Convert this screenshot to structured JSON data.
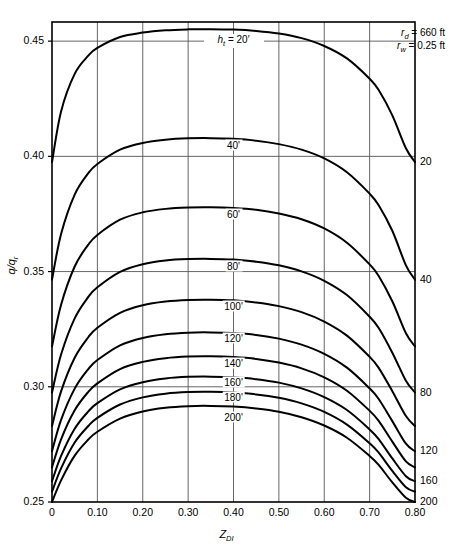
{
  "chart_data": {
    "type": "line",
    "title": "",
    "xlabel": "Z_DI",
    "ylabel": "q/q_r",
    "xlim": [
      0,
      0.8
    ],
    "ylim": [
      0.25,
      0.4583
    ],
    "grid": true,
    "x_ticks": [
      "0",
      "0.10",
      "0.20",
      "0.30",
      "0.40",
      "0.50",
      "0.60",
      "0.70",
      "0.80"
    ],
    "x_tick_values": [
      0,
      0.1,
      0.2,
      0.3,
      0.4,
      0.5,
      0.6,
      0.7,
      0.8
    ],
    "y_ticks": [
      "0.25",
      "0.30",
      "0.35",
      "0.40",
      "0.45"
    ],
    "y_tick_values": [
      0.25,
      0.3,
      0.35,
      0.4,
      0.45
    ],
    "annotations": [
      {
        "name": "rd",
        "text": "r_d = 660 ft",
        "sym": "r",
        "sub": "d",
        "rest": " = 660 ft"
      },
      {
        "name": "rw",
        "text": "r_w = 0.25 ft",
        "sym": "r",
        "sub": "w",
        "rest": " = 0.25 ft"
      }
    ],
    "first_curve_label": {
      "sym": "h",
      "sub": "t",
      "rest": " = 20′"
    },
    "right_axis_labels": [
      "20",
      "40",
      "80",
      "120",
      "160",
      "200"
    ],
    "right_axis_values": [
      0.3975,
      0.3465,
      0.2975,
      0.272,
      0.259,
      0.25
    ],
    "series": [
      {
        "name": "20'",
        "label": "h_t = 20'",
        "x": [
          0,
          0.02,
          0.05,
          0.08,
          0.1,
          0.15,
          0.2,
          0.25,
          0.3,
          0.35,
          0.4,
          0.45,
          0.5,
          0.55,
          0.6,
          0.65,
          0.7,
          0.72,
          0.75,
          0.78,
          0.8
        ],
        "values": [
          0.3975,
          0.4195,
          0.4358,
          0.4437,
          0.4471,
          0.4518,
          0.4537,
          0.4547,
          0.4551,
          0.4552,
          0.455,
          0.4544,
          0.4533,
          0.4513,
          0.4479,
          0.4425,
          0.4337,
          0.4288,
          0.4178,
          0.4035,
          0.3975
        ]
      },
      {
        "name": "40'",
        "label": "40'",
        "x": [
          0,
          0.02,
          0.05,
          0.08,
          0.1,
          0.15,
          0.2,
          0.25,
          0.3,
          0.35,
          0.4,
          0.45,
          0.5,
          0.55,
          0.6,
          0.65,
          0.7,
          0.72,
          0.75,
          0.78,
          0.8
        ],
        "values": [
          0.3465,
          0.3663,
          0.3834,
          0.3927,
          0.3967,
          0.4029,
          0.4058,
          0.4072,
          0.4078,
          0.4079,
          0.4076,
          0.4068,
          0.4053,
          0.4029,
          0.3991,
          0.3931,
          0.3838,
          0.3788,
          0.3677,
          0.3527,
          0.3465
        ]
      },
      {
        "name": "60'",
        "label": "60'",
        "x": [
          0,
          0.02,
          0.05,
          0.08,
          0.1,
          0.15,
          0.2,
          0.25,
          0.3,
          0.35,
          0.4,
          0.45,
          0.5,
          0.55,
          0.6,
          0.65,
          0.7,
          0.72,
          0.75,
          0.78,
          0.8
        ],
        "values": [
          0.3175,
          0.3356,
          0.3522,
          0.3617,
          0.3659,
          0.3725,
          0.3757,
          0.3772,
          0.3778,
          0.3779,
          0.3776,
          0.3768,
          0.3752,
          0.3727,
          0.3687,
          0.3625,
          0.3531,
          0.3481,
          0.3371,
          0.3232,
          0.3175
        ]
      },
      {
        "name": "80'",
        "label": "80'",
        "x": [
          0,
          0.02,
          0.05,
          0.08,
          0.1,
          0.15,
          0.2,
          0.25,
          0.3,
          0.35,
          0.4,
          0.45,
          0.5,
          0.55,
          0.6,
          0.65,
          0.7,
          0.72,
          0.75,
          0.78,
          0.8
        ],
        "values": [
          0.2975,
          0.314,
          0.3297,
          0.339,
          0.3432,
          0.3499,
          0.3532,
          0.3548,
          0.3554,
          0.3555,
          0.3552,
          0.3543,
          0.3527,
          0.3501,
          0.346,
          0.3398,
          0.3304,
          0.3255,
          0.3148,
          0.3026,
          0.2975
        ]
      },
      {
        "name": "100'",
        "label": "100'",
        "x": [
          0,
          0.02,
          0.05,
          0.08,
          0.1,
          0.15,
          0.2,
          0.25,
          0.3,
          0.35,
          0.4,
          0.45,
          0.5,
          0.55,
          0.6,
          0.65,
          0.7,
          0.72,
          0.75,
          0.78,
          0.8
        ],
        "values": [
          0.283,
          0.298,
          0.3126,
          0.3215,
          0.3256,
          0.3321,
          0.3354,
          0.337,
          0.3377,
          0.3378,
          0.3375,
          0.3366,
          0.335,
          0.3324,
          0.3283,
          0.3222,
          0.313,
          0.3082,
          0.2981,
          0.2873,
          0.283
        ]
      },
      {
        "name": "120'",
        "label": "120'",
        "x": [
          0,
          0.02,
          0.05,
          0.08,
          0.1,
          0.15,
          0.2,
          0.25,
          0.3,
          0.35,
          0.4,
          0.45,
          0.5,
          0.55,
          0.6,
          0.65,
          0.7,
          0.72,
          0.75,
          0.78,
          0.8
        ],
        "values": [
          0.272,
          0.2856,
          0.2992,
          0.3077,
          0.3116,
          0.318,
          0.3212,
          0.3228,
          0.3235,
          0.3236,
          0.3233,
          0.3225,
          0.3209,
          0.3183,
          0.3143,
          0.3083,
          0.2993,
          0.2947,
          0.2851,
          0.2753,
          0.272
        ]
      },
      {
        "name": "140'",
        "label": "140'",
        "x": [
          0,
          0.02,
          0.05,
          0.08,
          0.1,
          0.15,
          0.2,
          0.25,
          0.3,
          0.35,
          0.4,
          0.45,
          0.5,
          0.55,
          0.6,
          0.65,
          0.7,
          0.72,
          0.75,
          0.78,
          0.8
        ],
        "values": [
          0.265,
          0.2772,
          0.2898,
          0.2978,
          0.3015,
          0.3077,
          0.3108,
          0.3124,
          0.3131,
          0.3132,
          0.3129,
          0.3121,
          0.3105,
          0.308,
          0.3041,
          0.2983,
          0.2896,
          0.2852,
          0.2762,
          0.2676,
          0.265
        ]
      },
      {
        "name": "160'",
        "label": "160'",
        "x": [
          0,
          0.02,
          0.05,
          0.08,
          0.1,
          0.15,
          0.2,
          0.25,
          0.3,
          0.35,
          0.4,
          0.45,
          0.5,
          0.55,
          0.6,
          0.65,
          0.7,
          0.72,
          0.75,
          0.78,
          0.8
        ],
        "values": [
          0.259,
          0.27,
          0.2818,
          0.2893,
          0.2929,
          0.2989,
          0.302,
          0.3036,
          0.3043,
          0.3044,
          0.3041,
          0.3033,
          0.3018,
          0.2993,
          0.2955,
          0.2899,
          0.2815,
          0.2773,
          0.2689,
          0.2612,
          0.259
        ]
      },
      {
        "name": "180'",
        "label": "180'",
        "x": [
          0,
          0.02,
          0.05,
          0.08,
          0.1,
          0.15,
          0.2,
          0.25,
          0.3,
          0.35,
          0.4,
          0.45,
          0.5,
          0.55,
          0.6,
          0.65,
          0.7,
          0.72,
          0.75,
          0.78,
          0.8
        ],
        "values": [
          0.2545,
          0.2646,
          0.2758,
          0.283,
          0.2865,
          0.2923,
          0.2954,
          0.297,
          0.2977,
          0.2978,
          0.2975,
          0.2967,
          0.2952,
          0.2928,
          0.2891,
          0.2836,
          0.2755,
          0.2714,
          0.2635,
          0.2564,
          0.2545
        ]
      },
      {
        "name": "200'",
        "label": "200'",
        "x": [
          0,
          0.02,
          0.05,
          0.08,
          0.1,
          0.15,
          0.2,
          0.25,
          0.3,
          0.35,
          0.4,
          0.45,
          0.5,
          0.55,
          0.6,
          0.65,
          0.7,
          0.72,
          0.75,
          0.78,
          0.8
        ],
        "values": [
          0.25,
          0.2594,
          0.2701,
          0.2771,
          0.2805,
          0.2862,
          0.2893,
          0.2909,
          0.2916,
          0.2917,
          0.2914,
          0.2906,
          0.2892,
          0.2868,
          0.2832,
          0.2779,
          0.27,
          0.2661,
          0.2585,
          0.2518,
          0.25
        ]
      }
    ],
    "curve_label_positions": [
      {
        "label": "h_t = 20'",
        "x": 0.4,
        "y": 0.45,
        "is_first": true
      },
      {
        "label": "40'",
        "x": 0.4,
        "y": 0.405
      },
      {
        "label": "60'",
        "x": 0.4,
        "y": 0.375
      },
      {
        "label": "80'",
        "x": 0.4,
        "y": 0.3525
      },
      {
        "label": "100'",
        "x": 0.4,
        "y": 0.335
      },
      {
        "label": "120'",
        "x": 0.4,
        "y": 0.321
      },
      {
        "label": "140'",
        "x": 0.4,
        "y": 0.3105
      },
      {
        "label": "160'",
        "x": 0.4,
        "y": 0.302
      },
      {
        "label": "180'",
        "x": 0.4,
        "y": 0.2955
      },
      {
        "label": "200'",
        "x": 0.4,
        "y": 0.287
      }
    ],
    "colors": {
      "curve": "#000000",
      "grid": "#555555",
      "axis": "#000000",
      "background": "#ffffff"
    }
  }
}
